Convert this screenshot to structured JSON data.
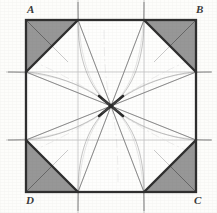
{
  "figure": {
    "kind": "geometric-construction-diagram",
    "background_color": "#fdfdfb",
    "ink_color": "#3a3a3a",
    "shade_color": "#8e8e8e",
    "faint_line_color": "#9a9a9a",
    "square": {
      "corners": {
        "A": {
          "x": 26,
          "y": 20
        },
        "B": {
          "x": 196,
          "y": 20
        },
        "C": {
          "x": 196,
          "y": 192
        },
        "D": {
          "x": 26,
          "y": 192
        }
      },
      "stroke_width": 2.2
    },
    "octagon_cut_points": {
      "top_left_on_top_edge": {
        "x": 78,
        "y": 20
      },
      "top_right_on_top_edge": {
        "x": 144,
        "y": 20
      },
      "right_top_on_right_edge": {
        "x": 196,
        "y": 72
      },
      "right_bottom_on_right_edge": {
        "x": 196,
        "y": 140
      },
      "bottom_right_on_bottom_edge": {
        "x": 144,
        "y": 192
      },
      "bottom_left_on_bottom_edge": {
        "x": 78,
        "y": 192
      },
      "left_bottom_on_left_edge": {
        "x": 26,
        "y": 140
      },
      "left_top_on_left_edge": {
        "x": 26,
        "y": 72
      }
    },
    "center_point": {
      "x": 111,
      "y": 106
    },
    "shaded_triangles": [
      {
        "name": "corner-triangle-A",
        "points": "26,20 78,20 26,72"
      },
      {
        "name": "corner-triangle-B",
        "points": "196,20 196,72 144,20"
      },
      {
        "name": "corner-triangle-C",
        "points": "196,192 144,192 196,140"
      },
      {
        "name": "corner-triangle-D",
        "points": "26,192 26,140 78,192"
      }
    ],
    "extension_lines": {
      "vertical_x": [
        78,
        144
      ],
      "horizontal_y": [
        72,
        140
      ],
      "overshoot_px": 18
    },
    "labels": {
      "A": "A",
      "B": "B",
      "C": "C",
      "D": "D"
    }
  }
}
